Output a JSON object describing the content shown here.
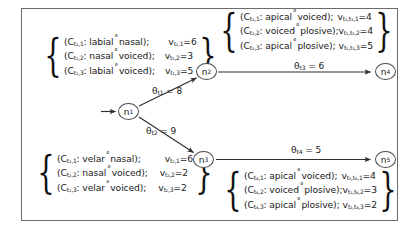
{
  "figure": {
    "nodes": [
      {
        "id": "n1",
        "label": "n",
        "sub": "1"
      },
      {
        "id": "n2",
        "label": "n",
        "sub": "2"
      },
      {
        "id": "n3",
        "label": "n",
        "sub": "3"
      },
      {
        "id": "n4",
        "label": "n",
        "sub": "4"
      },
      {
        "id": "n5",
        "label": "n",
        "sub": "5"
      }
    ],
    "edges": [
      {
        "id": "e1",
        "from": "n1",
        "to": "n2",
        "theta_sym": "θ",
        "theta_sub": "t1",
        "eq": "= 8",
        "full": "θt1 = 8"
      },
      {
        "id": "e2",
        "from": "n1",
        "to": "n3",
        "theta_sym": "θ",
        "theta_sub": "t2",
        "eq": "= 9",
        "full": "θt2 = 9"
      },
      {
        "id": "e3",
        "from": "n2",
        "to": "n4",
        "theta_sym": "θ",
        "theta_sub": "t3",
        "eq": "= 6",
        "full": "θt3 = 6"
      },
      {
        "id": "e4",
        "from": "n3",
        "to": "n5",
        "theta_sym": "θ",
        "theta_sub": "t4",
        "eq": "= 5",
        "full": "θt4 = 5"
      }
    ],
    "boxes": {
      "top_left": {
        "name": "constraint-box-t1",
        "rows": [
          {
            "c_sym": "(C",
            "c_sub": "t₁,1",
            "c_tail": ": labial",
            "c_tail2": "nasal);",
            "v_sym": "v",
            "v_sub": "t₁,1",
            "v_eq": "=6"
          },
          {
            "c_sym": "(C",
            "c_sub": "t₁,2",
            "c_tail": ": nasal",
            "c_tail2": "voiced);",
            "v_sym": "v",
            "v_sub": "t₁,2",
            "v_eq": "=3"
          },
          {
            "c_sym": "(C",
            "c_sub": "t₁,3",
            "c_tail": ": labial",
            "c_tail2": "voiced);",
            "v_sym": "v",
            "v_sub": "t₁,3",
            "v_eq": "=5"
          }
        ]
      },
      "bottom_left": {
        "name": "constraint-box-t2",
        "rows": [
          {
            "c_sym": "(C",
            "c_sub": "t₂,1",
            "c_tail": ": velar",
            "c_tail2": "nasal);",
            "v_sym": "v",
            "v_sub": "t₂,1",
            "v_eq": "=6"
          },
          {
            "c_sym": "(C",
            "c_sub": "t₂,2",
            "c_tail": ": nasal",
            "c_tail2": "voiced);",
            "v_sym": "v",
            "v_sub": "t₂,2",
            "v_eq": "=2"
          },
          {
            "c_sym": "(C",
            "c_sub": "t₂,3",
            "c_tail": ": velar",
            "c_tail2": "voiced);",
            "v_sym": "v",
            "v_sub": "t₂,3",
            "v_eq": "=2"
          }
        ]
      },
      "top_right": {
        "name": "constraint-box-t3",
        "rows": [
          {
            "c_sym": "(C",
            "c_sub": "t₃,1",
            "c_tail": ": apical",
            "c_tail2": "voiced);",
            "v_sym": "v",
            "v_sub": "t₁,t₃,1",
            "v_eq": "=4"
          },
          {
            "c_sym": "(C",
            "c_sub": "t₃,2",
            "c_tail": ": voiced",
            "c_tail2": "plosive);",
            "v_sym": "v",
            "v_sub": "t₁,t₃,2",
            "v_eq": "=4"
          },
          {
            "c_sym": "(C",
            "c_sub": "t₃,3",
            "c_tail": ": apical",
            "c_tail2": "plosive);",
            "v_sym": "v",
            "v_sub": "t₁,t₃,3",
            "v_eq": "=5"
          }
        ]
      },
      "bottom_right": {
        "name": "constraint-box-t4",
        "rows": [
          {
            "c_sym": "(C",
            "c_sub": "t₄,1",
            "c_tail": ": apical",
            "c_tail2": "voiced);",
            "v_sym": "v",
            "v_sub": "t₂,t₄,1",
            "v_eq": "=4"
          },
          {
            "c_sym": "(C",
            "c_sub": "t₄,2",
            "c_tail": ": voiced",
            "c_tail2": "plosive);",
            "v_sym": "v",
            "v_sub": "t₂,t₄,2",
            "v_eq": "=3"
          },
          {
            "c_sym": "(C",
            "c_sub": "t₄,3",
            "c_tail": ": apical",
            "c_tail2": "plosive);",
            "v_sym": "v",
            "v_sub": "t₂,t₄,3",
            "v_eq": "=2"
          }
        ]
      }
    },
    "colors": {
      "frame": "#6b6b6b",
      "node_stroke": "#4a4a4a",
      "edge": "#3a3a3a",
      "text": "#1a1a1a",
      "background": "#ffffff"
    }
  }
}
